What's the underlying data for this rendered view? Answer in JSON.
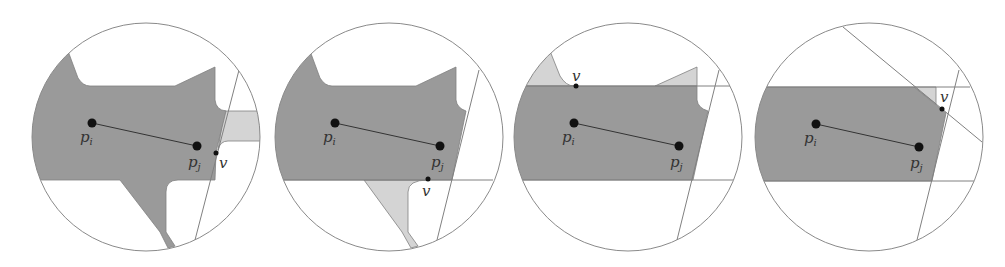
{
  "figure": {
    "panels": [
      {
        "id": "panel-1",
        "labels": {
          "pi": "p",
          "pi_sub": "i",
          "pj": "p",
          "pj_sub": "j",
          "v": "v"
        }
      },
      {
        "id": "panel-2",
        "labels": {
          "pi": "p",
          "pi_sub": "i",
          "pj": "p",
          "pj_sub": "j",
          "v": "v"
        }
      },
      {
        "id": "panel-3",
        "labels": {
          "pi": "p",
          "pi_sub": "i",
          "pj": "p",
          "pj_sub": "j",
          "v": "v"
        }
      },
      {
        "id": "panel-4",
        "labels": {
          "pi": "p",
          "pi_sub": "i",
          "pj": "p",
          "pj_sub": "j",
          "v": "v"
        }
      }
    ],
    "colors": {
      "dark_region": "#9a9a9a",
      "light_region": "#d4d4d4",
      "outline": "#808080",
      "point": "#111111"
    }
  }
}
